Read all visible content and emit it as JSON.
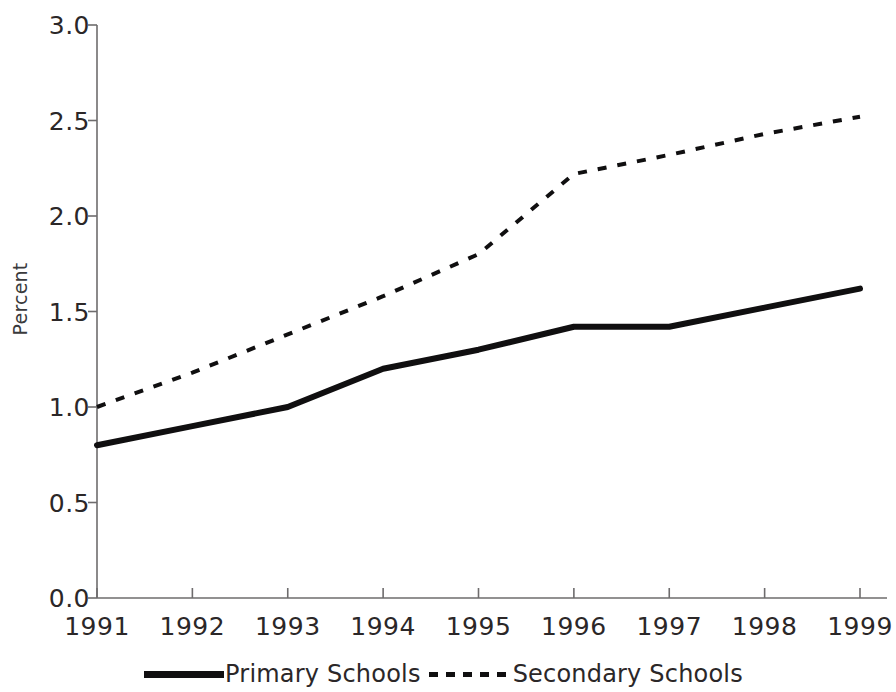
{
  "chart_data": {
    "type": "line",
    "title": "",
    "subtitle": "",
    "xlabel": "",
    "ylabel": "Percent",
    "x": [
      1991,
      1992,
      1993,
      1994,
      1995,
      1996,
      1997,
      1998,
      1999
    ],
    "categories": [
      "1991",
      "1992",
      "1993",
      "1994",
      "1995",
      "1996",
      "1997",
      "1998",
      "1999"
    ],
    "xtick_labels": [
      "1991",
      "1992",
      "1993",
      "1994",
      "1995",
      "1996",
      "1997",
      "1998",
      "1999"
    ],
    "ytick_labels": [
      "0.0",
      "0.5",
      "1.0",
      "1.5",
      "2.0",
      "2.5",
      "3.0"
    ],
    "ytick_values": [
      0.0,
      0.5,
      1.0,
      1.5,
      2.0,
      2.5,
      3.0
    ],
    "ylim": [
      0.0,
      3.0
    ],
    "xlim": [
      1991,
      1999
    ],
    "grid": false,
    "legend_position": "bottom",
    "series": [
      {
        "name": "Primary Schools",
        "style": "solid",
        "color": "#100f10",
        "linewidth": 6,
        "values": [
          0.8,
          0.9,
          1.0,
          1.2,
          1.3,
          1.42,
          1.42,
          1.52,
          1.62
        ]
      },
      {
        "name": "Secondary Schools",
        "style": "dotted",
        "color": "#100f10",
        "linewidth": 4,
        "values": [
          1.0,
          1.18,
          1.38,
          1.58,
          1.8,
          2.22,
          2.32,
          2.43,
          2.52
        ]
      }
    ]
  },
  "legend": {
    "entries": [
      {
        "label": "Primary Schools",
        "style": "solid"
      },
      {
        "label": "Secondary Schools",
        "style": "dotted"
      }
    ]
  },
  "axes": {
    "y_axis_title": "Percent"
  },
  "colors": {
    "line": "#100f10",
    "axis": "#6e6c6d",
    "text": "#2b2728",
    "background": "#ffffff"
  }
}
